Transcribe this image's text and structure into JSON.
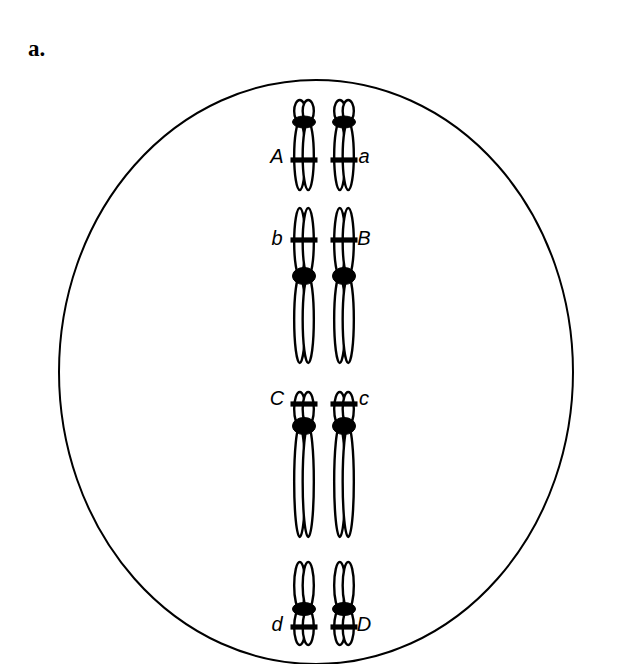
{
  "figure": {
    "panel_label": "a.",
    "diagram_type": "cell-with-homologous-chromosome-pairs",
    "colors": {
      "outline": "#000000",
      "fill": "#ffffff",
      "centromere": "#000000",
      "background": "#ffffff"
    },
    "cell": {
      "name": "cell-membrane",
      "shape": "circle",
      "center_x": 316,
      "center_y": 372,
      "radius_x": 257,
      "radius_y": 292,
      "stroke_width": 2
    },
    "chromosome_pairs": [
      {
        "id": "pair-1",
        "left_label": "A",
        "right_label": "a",
        "center_y": 142,
        "top": 100,
        "bottom": 190,
        "short_arm_length": 26,
        "long_arm_length": 62,
        "centromere_y": 122,
        "band_y": 160,
        "label_y": 163,
        "left_x": 304,
        "right_x": 344,
        "left_label_x": 277,
        "right_label_x": 364
      },
      {
        "id": "pair-2",
        "left_label": "b",
        "right_label": "B",
        "center_y": 285,
        "top": 208,
        "bottom": 363,
        "short_arm_length": 65,
        "long_arm_length": 86,
        "centromere_y": 276,
        "band_y": 240,
        "label_y": 245,
        "left_x": 304,
        "right_x": 344,
        "left_label_x": 277,
        "right_label_x": 364
      },
      {
        "id": "pair-3",
        "left_label": "C",
        "right_label": "c",
        "center_y": 462,
        "top": 392,
        "bottom": 537,
        "short_arm_length": 32,
        "long_arm_length": 103,
        "centromere_y": 426,
        "band_y": 404,
        "label_y": 405,
        "left_x": 304,
        "right_x": 344,
        "left_label_x": 277,
        "right_label_x": 364
      },
      {
        "id": "pair-4",
        "left_label": "d",
        "right_label": "D",
        "center_y": 602,
        "top": 562,
        "bottom": 645,
        "short_arm_length": 30,
        "long_arm_length": 50,
        "centromere_y": 609,
        "band_y": 627,
        "label_y": 631,
        "left_x": 304,
        "right_x": 344,
        "left_label_x": 277,
        "right_label_x": 364
      }
    ]
  }
}
